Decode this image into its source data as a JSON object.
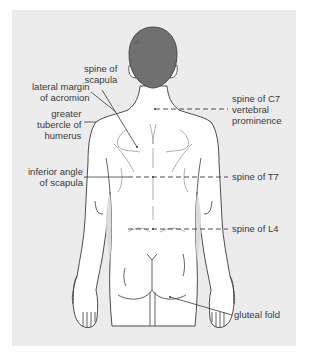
{
  "figure": {
    "colors": {
      "panel": "#ececec",
      "hair": "#707070",
      "skin": "#ffffff",
      "outline": "#3a3a3a",
      "shadow": "#d9d9d9",
      "leader": "#3a3a3a"
    }
  },
  "labels": {
    "spine_of_scapula": {
      "line1": "spine of",
      "line2": "scapula"
    },
    "lateral_margin_acromion": {
      "line1": "lateral margin",
      "line2": "of acromion"
    },
    "greater_tubercle": {
      "line1": "greater",
      "line2": "tubercle of",
      "line3": "humerus"
    },
    "inferior_angle_scapula": {
      "line1": "inferior angle",
      "line2": "of scapula"
    },
    "spine_c7": {
      "line1": "spine of C7",
      "line2": "vertebral",
      "line3": "prominence"
    },
    "spine_t7": {
      "line1": "spine of T7"
    },
    "spine_l4": {
      "line1": "spine of L4"
    },
    "gluteal_fold": {
      "line1": "gluteal fold"
    }
  }
}
